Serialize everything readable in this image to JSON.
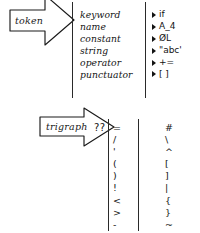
{
  "diagram": {
    "title_hidden": "C token and trigraph hand-drawn chart",
    "ink_color": "#131313",
    "background_color": "#ffffff",
    "token_group": {
      "arrow_label": "token",
      "categories": [
        "keyword",
        "name",
        "constant",
        "string",
        "operator",
        "punctuator"
      ],
      "examples": [
        "if",
        "A_4",
        "ØL",
        "\"abc'",
        "+=",
        "[ ]"
      ]
    },
    "trigraph_group": {
      "arrow_label": "trigraph",
      "prefix": "??",
      "sources": [
        "=",
        "/",
        "'",
        "(",
        ")",
        "!",
        "<",
        ">",
        "-"
      ],
      "replacements": [
        "#",
        "\\",
        "^",
        "[",
        "]",
        "|",
        "{",
        "}",
        "~"
      ]
    }
  }
}
